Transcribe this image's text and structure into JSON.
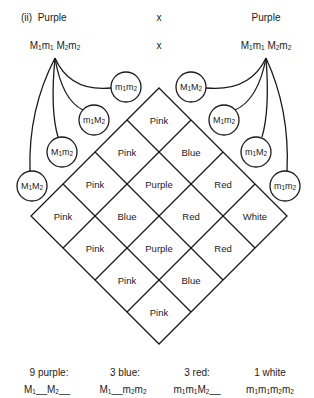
{
  "header": {
    "label": "(ii)",
    "parent1_phenotype": "Purple",
    "cross_symbol": "x",
    "parent2_phenotype": "Purple",
    "parent1_genotype": "M1m1 M2m2",
    "parent2_genotype": "M1m1 M2m2"
  },
  "gametes": {
    "left": [
      "m1m2",
      "m1M2",
      "M1m2",
      "M1M2"
    ],
    "right": [
      "M1M2",
      "M1m2",
      "m1M2",
      "m1m2"
    ]
  },
  "grid": {
    "rows": [
      [
        "Pink"
      ],
      [
        "Pink",
        "Blue"
      ],
      [
        "Pink",
        "Purple",
        "Red"
      ],
      [
        "Pink",
        "Blue",
        "Red",
        "White"
      ],
      [
        "Pink",
        "Purple",
        "Red"
      ],
      [
        "Pink",
        "Blue"
      ],
      [
        "Pink"
      ]
    ]
  },
  "summary": [
    {
      "ratio": "9 purple:",
      "genotype": "M1__M2__"
    },
    {
      "ratio": "3 blue:",
      "genotype": "M1__m2m2"
    },
    {
      "ratio": "3 red:",
      "genotype": "m1m1M2__"
    },
    {
      "ratio": "1 white",
      "genotype": "m1m1m2m2"
    }
  ]
}
